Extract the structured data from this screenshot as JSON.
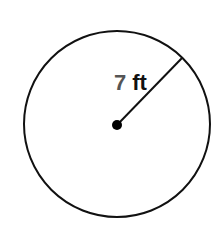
{
  "diagram": {
    "shape": "circle",
    "radius_value": "7",
    "radius_unit": "ft",
    "colors": {
      "stroke": "#111111",
      "value_text": "#555555",
      "unit_text": "#111111"
    }
  }
}
